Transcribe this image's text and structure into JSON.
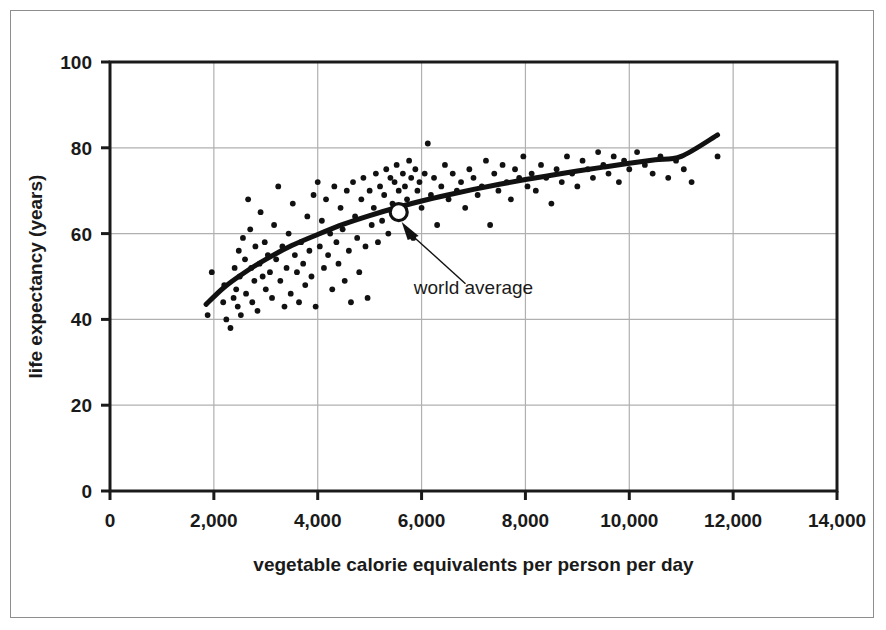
{
  "chart_data": {
    "type": "scatter",
    "title": "",
    "xlabel": "vegetable calorie equivalents per person per day",
    "ylabel": "life expectancy (years)",
    "xlim": [
      0,
      14000
    ],
    "ylim": [
      0,
      100
    ],
    "xticks": [
      0,
      2000,
      4000,
      6000,
      8000,
      10000,
      12000,
      14000
    ],
    "xticklabels": [
      "0",
      "2,000",
      "4,000",
      "6,000",
      "8,000",
      "10,000",
      "12,000",
      "14,000"
    ],
    "yticks": [
      0,
      20,
      40,
      60,
      80,
      100
    ],
    "yticklabels": [
      "0",
      "20",
      "40",
      "60",
      "80",
      "100"
    ],
    "grid": true,
    "grid_color": "#b0b0b0",
    "legend": "none",
    "marker_color": "#111111",
    "trend_color": "#111111",
    "annotations": [
      {
        "name": "world-average",
        "text": "world average",
        "point_x": 5560,
        "point_y": 65,
        "label_x": 7000,
        "label_y": 46
      }
    ],
    "series": [
      {
        "name": "countries",
        "points": [
          [
            1880,
            41
          ],
          [
            1960,
            51
          ],
          [
            2180,
            44
          ],
          [
            2200,
            48
          ],
          [
            2240,
            40
          ],
          [
            2320,
            38
          ],
          [
            2380,
            45
          ],
          [
            2400,
            52
          ],
          [
            2430,
            47
          ],
          [
            2460,
            43
          ],
          [
            2480,
            56
          ],
          [
            2500,
            50
          ],
          [
            2520,
            41
          ],
          [
            2560,
            59
          ],
          [
            2600,
            54
          ],
          [
            2620,
            46
          ],
          [
            2660,
            68
          ],
          [
            2700,
            61
          ],
          [
            2720,
            52
          ],
          [
            2740,
            44
          ],
          [
            2780,
            49
          ],
          [
            2800,
            57
          ],
          [
            2840,
            42
          ],
          [
            2880,
            53
          ],
          [
            2900,
            65
          ],
          [
            2940,
            50
          ],
          [
            2980,
            58
          ],
          [
            3000,
            47
          ],
          [
            3040,
            55
          ],
          [
            3080,
            51
          ],
          [
            3120,
            45
          ],
          [
            3160,
            62
          ],
          [
            3200,
            54
          ],
          [
            3240,
            71
          ],
          [
            3280,
            49
          ],
          [
            3320,
            57
          ],
          [
            3360,
            43
          ],
          [
            3400,
            52
          ],
          [
            3440,
            60
          ],
          [
            3480,
            46
          ],
          [
            3520,
            67
          ],
          [
            3560,
            55
          ],
          [
            3600,
            51
          ],
          [
            3640,
            44
          ],
          [
            3680,
            58
          ],
          [
            3720,
            53
          ],
          [
            3760,
            48
          ],
          [
            3800,
            64
          ],
          [
            3840,
            56
          ],
          [
            3880,
            50
          ],
          [
            3920,
            69
          ],
          [
            3960,
            43
          ],
          [
            4000,
            72
          ],
          [
            4040,
            57
          ],
          [
            4080,
            63
          ],
          [
            4120,
            52
          ],
          [
            4160,
            68
          ],
          [
            4200,
            55
          ],
          [
            4240,
            60
          ],
          [
            4280,
            47
          ],
          [
            4320,
            71
          ],
          [
            4360,
            58
          ],
          [
            4400,
            53
          ],
          [
            4440,
            66
          ],
          [
            4480,
            61
          ],
          [
            4520,
            49
          ],
          [
            4560,
            70
          ],
          [
            4600,
            56
          ],
          [
            4640,
            44
          ],
          [
            4680,
            72
          ],
          [
            4720,
            64
          ],
          [
            4760,
            59
          ],
          [
            4800,
            51
          ],
          [
            4840,
            68
          ],
          [
            4880,
            73
          ],
          [
            4920,
            57
          ],
          [
            4960,
            45
          ],
          [
            5000,
            70
          ],
          [
            5040,
            62
          ],
          [
            5080,
            66
          ],
          [
            5120,
            74
          ],
          [
            5160,
            58
          ],
          [
            5200,
            71
          ],
          [
            5240,
            63
          ],
          [
            5280,
            69
          ],
          [
            5320,
            75
          ],
          [
            5360,
            60
          ],
          [
            5400,
            73
          ],
          [
            5440,
            67
          ],
          [
            5480,
            72
          ],
          [
            5520,
            76
          ],
          [
            5560,
            70
          ],
          [
            5600,
            65
          ],
          [
            5640,
            74
          ],
          [
            5680,
            71
          ],
          [
            5720,
            68
          ],
          [
            5760,
            77
          ],
          [
            5800,
            73
          ],
          [
            5840,
            59
          ],
          [
            5880,
            75
          ],
          [
            5920,
            70
          ],
          [
            5960,
            72
          ],
          [
            6000,
            66
          ],
          [
            6060,
            74
          ],
          [
            6120,
            81
          ],
          [
            6180,
            69
          ],
          [
            6240,
            73
          ],
          [
            6300,
            62
          ],
          [
            6380,
            71
          ],
          [
            6450,
            76
          ],
          [
            6520,
            68
          ],
          [
            6600,
            74
          ],
          [
            6680,
            70
          ],
          [
            6760,
            72
          ],
          [
            6840,
            66
          ],
          [
            6920,
            75
          ],
          [
            7000,
            73
          ],
          [
            7080,
            69
          ],
          [
            7160,
            71
          ],
          [
            7240,
            77
          ],
          [
            7320,
            62
          ],
          [
            7400,
            74
          ],
          [
            7480,
            70
          ],
          [
            7560,
            76
          ],
          [
            7640,
            72
          ],
          [
            7720,
            68
          ],
          [
            7800,
            75
          ],
          [
            7880,
            73
          ],
          [
            7960,
            78
          ],
          [
            8040,
            71
          ],
          [
            8120,
            74
          ],
          [
            8200,
            70
          ],
          [
            8300,
            76
          ],
          [
            8400,
            73
          ],
          [
            8500,
            67
          ],
          [
            8600,
            75
          ],
          [
            8700,
            72
          ],
          [
            8800,
            78
          ],
          [
            8900,
            74
          ],
          [
            9000,
            71
          ],
          [
            9100,
            77
          ],
          [
            9200,
            75
          ],
          [
            9300,
            73
          ],
          [
            9400,
            79
          ],
          [
            9500,
            76
          ],
          [
            9600,
            74
          ],
          [
            9700,
            78
          ],
          [
            9800,
            72
          ],
          [
            9900,
            77
          ],
          [
            10000,
            75
          ],
          [
            10150,
            79
          ],
          [
            10300,
            76
          ],
          [
            10450,
            74
          ],
          [
            10600,
            78
          ],
          [
            10750,
            73
          ],
          [
            10900,
            77
          ],
          [
            11050,
            75
          ],
          [
            11200,
            72
          ],
          [
            11700,
            78
          ]
        ]
      }
    ],
    "trend_line": {
      "name": "fitted-trend",
      "points": [
        [
          1850,
          43.5
        ],
        [
          2200,
          47.5
        ],
        [
          2600,
          51.0
        ],
        [
          3000,
          54.0
        ],
        [
          3500,
          57.2
        ],
        [
          4000,
          59.8
        ],
        [
          4500,
          62.2
        ],
        [
          5000,
          64.2
        ],
        [
          5560,
          66.2
        ],
        [
          6000,
          67.6
        ],
        [
          6500,
          69.0
        ],
        [
          7000,
          70.3
        ],
        [
          7500,
          71.5
        ],
        [
          8000,
          72.6
        ],
        [
          8500,
          73.6
        ],
        [
          9000,
          74.6
        ],
        [
          9500,
          75.5
        ],
        [
          10000,
          76.4
        ],
        [
          10500,
          77.2
        ],
        [
          11000,
          78.0
        ],
        [
          11700,
          83.0
        ]
      ]
    }
  }
}
